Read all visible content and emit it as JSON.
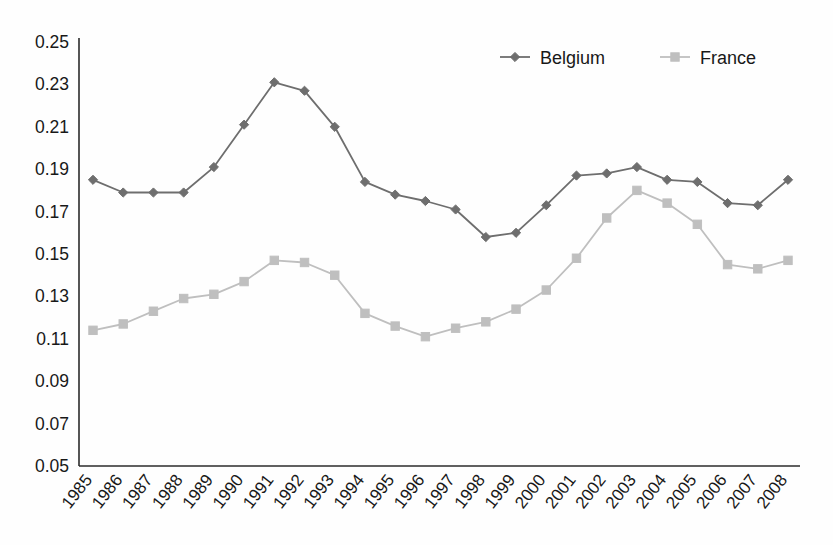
{
  "chart_data": {
    "type": "line",
    "title": "",
    "xlabel": "",
    "ylabel": "",
    "ylim": [
      0.05,
      0.25
    ],
    "ytick_step": 0.02,
    "grid": false,
    "legend_position": "top-right",
    "categories": [
      "1985",
      "1986",
      "1987",
      "1988",
      "1989",
      "1990",
      "1991",
      "1992",
      "1993",
      "1994",
      "1995",
      "1996",
      "1997",
      "1998",
      "1999",
      "2000",
      "2001",
      "2002",
      "2003",
      "2004",
      "2005",
      "2006",
      "2007",
      "2008"
    ],
    "ytick_labels": [
      "0.25",
      "0.23",
      "0.21",
      "0.19",
      "0.17",
      "0.15",
      "0.13",
      "0.11",
      "0.09",
      "0.07",
      "0.05"
    ],
    "ytick_values": [
      0.25,
      0.23,
      0.21,
      0.19,
      0.17,
      0.15,
      0.13,
      0.11,
      0.09,
      0.07,
      0.05
    ],
    "series": [
      {
        "name": "Belgium",
        "color": "#6e6e6e",
        "marker": "diamond",
        "values": [
          0.185,
          0.179,
          0.179,
          0.179,
          0.191,
          0.211,
          0.231,
          0.227,
          0.21,
          0.184,
          0.178,
          0.175,
          0.171,
          0.158,
          0.16,
          0.173,
          0.187,
          0.188,
          0.191,
          0.185,
          0.184,
          0.174,
          0.173,
          0.185
        ]
      },
      {
        "name": "France",
        "color": "#bfbfbf",
        "marker": "square",
        "values": [
          0.114,
          0.117,
          0.123,
          0.129,
          0.131,
          0.137,
          0.147,
          0.146,
          0.14,
          0.122,
          0.116,
          0.111,
          0.115,
          0.118,
          0.124,
          0.133,
          0.148,
          0.167,
          0.18,
          0.174,
          0.164,
          0.145,
          0.143,
          0.147
        ]
      }
    ]
  },
  "legend": {
    "items": [
      {
        "label": "Belgium",
        "color": "#6e6e6e",
        "marker": "diamond"
      },
      {
        "label": "France",
        "color": "#bfbfbf",
        "marker": "square"
      }
    ]
  },
  "top_remnant": {
    "text": ""
  }
}
